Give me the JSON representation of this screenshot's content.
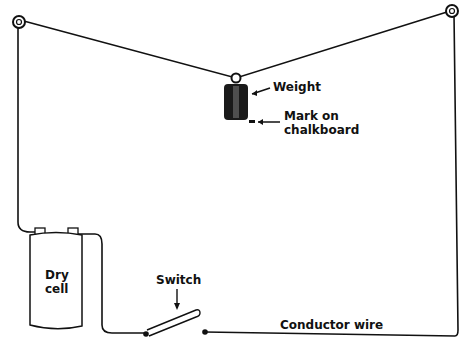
{
  "diagram": {
    "labels": {
      "weight": "Weight",
      "mark_line1": "Mark on",
      "mark_line2": "chalkboard",
      "cell_line1": "Dry",
      "cell_line2": "cell",
      "switch": "Switch",
      "wire": "Conductor wire"
    },
    "colors": {
      "ink": "#111111",
      "background": "#ffffff"
    }
  }
}
